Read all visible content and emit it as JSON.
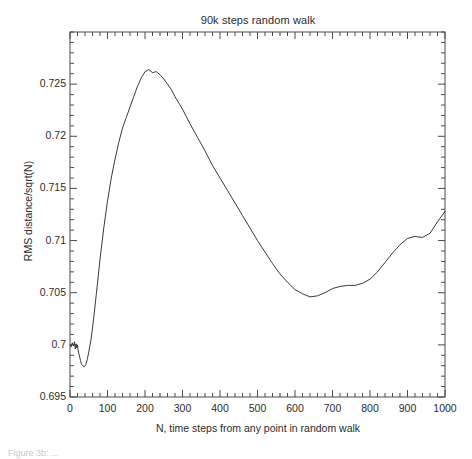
{
  "figure": {
    "caption_fragment": "Figure 3b: ..."
  },
  "chart_data": {
    "type": "line",
    "title": "90k steps random walk",
    "xlabel": "N, time steps from any point in random walk",
    "ylabel": "RMS distance/sqrt(N)",
    "xlim": [
      0,
      1000
    ],
    "ylim": [
      0.695,
      0.73
    ],
    "grid": false,
    "legend": null,
    "xticks": [
      0,
      100,
      200,
      300,
      400,
      500,
      600,
      700,
      800,
      900,
      1000
    ],
    "xtick_labels": [
      "0",
      "100",
      "200",
      "300",
      "400",
      "500",
      "600",
      "700",
      "800",
      "900",
      "1000"
    ],
    "x_minor_tick_step": 20,
    "yticks": [
      0.695,
      0.7,
      0.705,
      0.71,
      0.715,
      0.72,
      0.725
    ],
    "ytick_labels": [
      "0.695",
      "0.7",
      "0.705",
      "0.71",
      "0.715",
      "0.72",
      "0.725"
    ],
    "y_minor_tick_step": 0.001,
    "line_color": "#3a3a3a",
    "line_width": 1.0,
    "series": [
      {
        "name": "RMS distance/sqrt(N)",
        "x": [
          1,
          3,
          6,
          9,
          12,
          14,
          16,
          18,
          20,
          22,
          24,
          26,
          28,
          30,
          34,
          38,
          42,
          46,
          50,
          56,
          62,
          70,
          80,
          90,
          100,
          110,
          120,
          130,
          140,
          150,
          160,
          170,
          180,
          190,
          200,
          210,
          220,
          230,
          240,
          250,
          260,
          270,
          280,
          290,
          300,
          320,
          340,
          360,
          380,
          400,
          420,
          440,
          460,
          480,
          500,
          520,
          540,
          560,
          580,
          600,
          620,
          640,
          660,
          680,
          700,
          720,
          740,
          760,
          780,
          800,
          820,
          840,
          860,
          880,
          900,
          920,
          940,
          960,
          980,
          1000
        ],
        "y": [
          0.7,
          0.6998,
          0.7002,
          0.6999,
          0.7003,
          0.6996,
          0.7001,
          0.6997,
          0.7,
          0.6994,
          0.6991,
          0.6988,
          0.6985,
          0.6982,
          0.698,
          0.6979,
          0.6981,
          0.6986,
          0.6993,
          0.7005,
          0.7022,
          0.7048,
          0.7082,
          0.7112,
          0.7138,
          0.716,
          0.7178,
          0.7194,
          0.7208,
          0.7218,
          0.7228,
          0.7238,
          0.7248,
          0.7256,
          0.7262,
          0.7264,
          0.7261,
          0.7262,
          0.7259,
          0.7255,
          0.725,
          0.7245,
          0.7238,
          0.7232,
          0.7226,
          0.7212,
          0.7199,
          0.7186,
          0.7172,
          0.716,
          0.7148,
          0.7136,
          0.7124,
          0.7112,
          0.71,
          0.7089,
          0.7078,
          0.7068,
          0.706,
          0.7053,
          0.7049,
          0.7046,
          0.7047,
          0.705,
          0.7054,
          0.7056,
          0.7057,
          0.7057,
          0.7059,
          0.7063,
          0.707,
          0.7079,
          0.7088,
          0.7096,
          0.7102,
          0.7104,
          0.7103,
          0.7107,
          0.7118,
          0.7128
        ]
      }
    ]
  }
}
